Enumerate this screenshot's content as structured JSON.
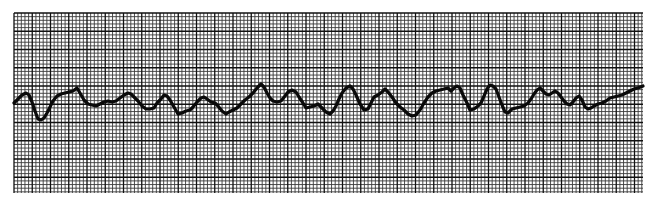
{
  "chart_data": {
    "type": "line",
    "title": "",
    "xlabel": "",
    "ylabel": "",
    "grid": true,
    "grid_area": {
      "x0": 14,
      "y0": 13,
      "x1": 643,
      "y1": 193
    },
    "small_square_px": 3.65,
    "large_square_every": 5,
    "colors": {
      "paper": "#ffffff",
      "grid_fine": "#3a3a3a",
      "grid_bold": "#111111",
      "trace": "#0a0a0a"
    },
    "trace_width": 3.2,
    "points": [
      [
        14,
        103
      ],
      [
        18,
        99
      ],
      [
        22,
        95
      ],
      [
        26,
        93
      ],
      [
        29,
        95
      ],
      [
        32,
        102
      ],
      [
        35,
        111
      ],
      [
        38,
        119
      ],
      [
        41,
        120
      ],
      [
        44,
        118
      ],
      [
        47,
        113
      ],
      [
        50,
        107
      ],
      [
        53,
        101
      ],
      [
        57,
        96
      ],
      [
        61,
        94
      ],
      [
        65,
        93
      ],
      [
        69,
        92
      ],
      [
        73,
        91
      ],
      [
        77,
        88
      ],
      [
        80,
        93
      ],
      [
        84,
        100
      ],
      [
        88,
        104
      ],
      [
        92,
        105
      ],
      [
        96,
        106
      ],
      [
        100,
        104
      ],
      [
        104,
        102
      ],
      [
        108,
        101
      ],
      [
        112,
        102
      ],
      [
        116,
        101
      ],
      [
        120,
        98
      ],
      [
        124,
        95
      ],
      [
        128,
        93
      ],
      [
        131,
        94
      ],
      [
        134,
        97
      ],
      [
        138,
        101
      ],
      [
        142,
        106
      ],
      [
        146,
        109
      ],
      [
        150,
        109
      ],
      [
        154,
        108
      ],
      [
        157,
        103
      ],
      [
        161,
        99
      ],
      [
        164,
        95
      ],
      [
        167,
        96
      ],
      [
        170,
        100
      ],
      [
        174,
        107
      ],
      [
        178,
        114
      ],
      [
        182,
        113
      ],
      [
        186,
        111
      ],
      [
        190,
        110
      ],
      [
        193,
        107
      ],
      [
        197,
        102
      ],
      [
        201,
        98
      ],
      [
        204,
        97
      ],
      [
        207,
        99
      ],
      [
        211,
        102
      ],
      [
        215,
        103
      ],
      [
        218,
        106
      ],
      [
        222,
        111
      ],
      [
        226,
        114
      ],
      [
        229,
        112
      ],
      [
        233,
        110
      ],
      [
        237,
        108
      ],
      [
        241,
        104
      ],
      [
        245,
        100
      ],
      [
        249,
        97
      ],
      [
        253,
        93
      ],
      [
        257,
        88
      ],
      [
        261,
        84
      ],
      [
        264,
        87
      ],
      [
        267,
        93
      ],
      [
        270,
        98
      ],
      [
        273,
        101
      ],
      [
        277,
        102
      ],
      [
        281,
        101
      ],
      [
        285,
        96
      ],
      [
        288,
        92
      ],
      [
        292,
        90
      ],
      [
        296,
        92
      ],
      [
        299,
        97
      ],
      [
        303,
        103
      ],
      [
        306,
        108
      ],
      [
        310,
        107
      ],
      [
        314,
        106
      ],
      [
        318,
        104
      ],
      [
        322,
        108
      ],
      [
        326,
        112
      ],
      [
        330,
        114
      ],
      [
        333,
        111
      ],
      [
        336,
        106
      ],
      [
        339,
        99
      ],
      [
        342,
        93
      ],
      [
        346,
        88
      ],
      [
        350,
        86
      ],
      [
        353,
        89
      ],
      [
        356,
        95
      ],
      [
        360,
        104
      ],
      [
        364,
        110
      ],
      [
        368,
        109
      ],
      [
        371,
        103
      ],
      [
        374,
        97
      ],
      [
        378,
        95
      ],
      [
        382,
        92
      ],
      [
        385,
        89
      ],
      [
        388,
        92
      ],
      [
        392,
        97
      ],
      [
        396,
        103
      ],
      [
        400,
        107
      ],
      [
        404,
        110
      ],
      [
        408,
        114
      ],
      [
        412,
        116
      ],
      [
        416,
        115
      ],
      [
        420,
        110
      ],
      [
        424,
        103
      ],
      [
        428,
        97
      ],
      [
        432,
        93
      ],
      [
        436,
        91
      ],
      [
        440,
        90
      ],
      [
        444,
        89
      ],
      [
        448,
        88
      ],
      [
        451,
        91
      ],
      [
        454,
        88
      ],
      [
        457,
        86
      ],
      [
        460,
        88
      ],
      [
        463,
        95
      ],
      [
        467,
        103
      ],
      [
        470,
        110
      ],
      [
        474,
        109
      ],
      [
        478,
        106
      ],
      [
        481,
        103
      ],
      [
        484,
        96
      ],
      [
        487,
        89
      ],
      [
        490,
        85
      ],
      [
        493,
        86
      ],
      [
        496,
        89
      ],
      [
        499,
        97
      ],
      [
        502,
        105
      ],
      [
        505,
        112
      ],
      [
        508,
        113
      ],
      [
        512,
        109
      ],
      [
        516,
        108
      ],
      [
        520,
        107
      ],
      [
        524,
        106
      ],
      [
        528,
        103
      ],
      [
        531,
        99
      ],
      [
        534,
        94
      ],
      [
        537,
        90
      ],
      [
        540,
        88
      ],
      [
        543,
        91
      ],
      [
        546,
        94
      ],
      [
        549,
        95
      ],
      [
        552,
        93
      ],
      [
        555,
        91
      ],
      [
        558,
        93
      ],
      [
        561,
        97
      ],
      [
        564,
        101
      ],
      [
        567,
        104
      ],
      [
        570,
        105
      ],
      [
        573,
        102
      ],
      [
        576,
        98
      ],
      [
        579,
        96
      ],
      [
        582,
        100
      ],
      [
        585,
        107
      ],
      [
        588,
        109
      ],
      [
        591,
        108
      ],
      [
        594,
        106
      ],
      [
        598,
        104
      ],
      [
        602,
        103
      ],
      [
        606,
        101
      ],
      [
        610,
        98
      ],
      [
        614,
        97
      ],
      [
        618,
        96
      ],
      [
        622,
        95
      ],
      [
        626,
        93
      ],
      [
        630,
        91
      ],
      [
        634,
        89
      ],
      [
        638,
        88
      ],
      [
        643,
        86
      ]
    ]
  }
}
